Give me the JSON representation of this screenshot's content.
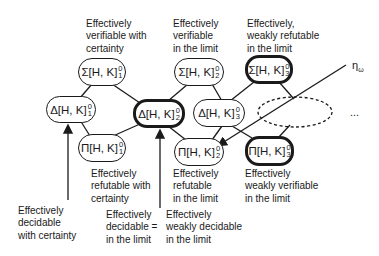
{
  "nodes": {
    "sigma1": {
      "sym": "Σ[H, K]",
      "sup": "0",
      "sub": "1"
    },
    "sigma2": {
      "sym": "Σ[H, K]",
      "sup": "0",
      "sub": "2"
    },
    "sigma3": {
      "sym": "Σ[H, K]",
      "sup": "0",
      "sub": "3"
    },
    "delta1": {
      "sym": "Δ[H, K]",
      "sup": "0",
      "sub": "1"
    },
    "delta2": {
      "sym": "Δ[H, K]",
      "sup": "0",
      "sub": "2"
    },
    "delta3": {
      "sym": "Δ[H, K]",
      "sup": "0",
      "sub": "3"
    },
    "pi1": {
      "sym": "Π[H, K]",
      "sup": "0",
      "sub": "1"
    },
    "pi2": {
      "sym": "Π[H, K]",
      "sup": "0",
      "sub": "2"
    },
    "pi3": {
      "sym": "Π[H, K]",
      "sup": "0",
      "sub": "3"
    }
  },
  "labels": {
    "sigma1": [
      "Effectively",
      "verifiable with",
      "certainty"
    ],
    "sigma2": [
      "Effectively",
      "verifiable",
      "in the limit"
    ],
    "sigma3": [
      "Effectively,",
      "weakly refutable",
      "in the limit"
    ],
    "pi1": [
      "Effectively",
      "refutable with",
      "certainty"
    ],
    "pi2": [
      "Effectively",
      "refutable",
      "in the limit"
    ],
    "pi3": [
      "Effectively",
      "weakly verifiable",
      "in the limit"
    ],
    "delta1": [
      "Effectively",
      "decidable",
      "with certainty"
    ],
    "delta2": [
      "Effectively",
      "decidable =",
      "in the limit"
    ],
    "weak_decidable": [
      "Effectively",
      "weakly decidable",
      "in the limit"
    ]
  },
  "eta_label": "η",
  "eta_sub": "ω",
  "ellipsis": "..."
}
